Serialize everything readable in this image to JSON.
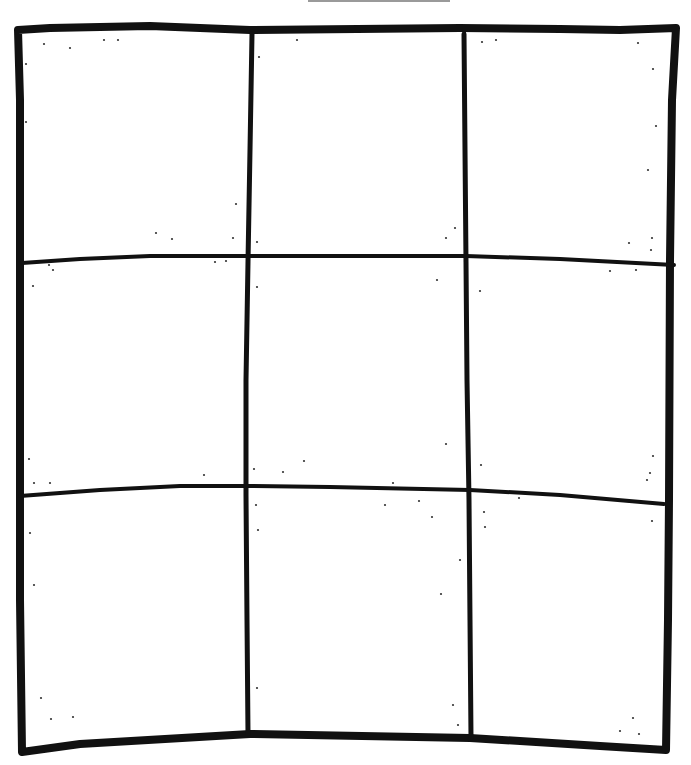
{
  "drawing": {
    "description": "Hand-drawn 3x3 grid",
    "rows": 3,
    "cols": 3,
    "stroke_color": "#111111",
    "top_bar": {
      "x": 308,
      "y": 0,
      "width": 142,
      "height": 2,
      "color": "#9a9a9a"
    },
    "outer_frame": {
      "stroke_width": 8,
      "points": [
        [
          18,
          30
        ],
        [
          50,
          28
        ],
        [
          150,
          26
        ],
        [
          250,
          30
        ],
        [
          460,
          28
        ],
        [
          560,
          29
        ],
        [
          620,
          30
        ],
        [
          676,
          28
        ],
        [
          672,
          100
        ],
        [
          670,
          260
        ],
        [
          669,
          500
        ],
        [
          668,
          620
        ],
        [
          666,
          750
        ],
        [
          600,
          746
        ],
        [
          470,
          738
        ],
        [
          250,
          734
        ],
        [
          80,
          744
        ],
        [
          22,
          752
        ],
        [
          20,
          600
        ],
        [
          20,
          420
        ],
        [
          20,
          262
        ],
        [
          20,
          100
        ],
        [
          18,
          30
        ]
      ]
    },
    "vertical_lines": [
      {
        "stroke_width": 5,
        "points": [
          [
            252,
            34
          ],
          [
            250,
            150
          ],
          [
            248,
            262
          ],
          [
            246,
            380
          ],
          [
            246,
            495
          ],
          [
            247,
            620
          ],
          [
            248,
            734
          ]
        ]
      },
      {
        "stroke_width": 5,
        "points": [
          [
            464,
            34
          ],
          [
            465,
            150
          ],
          [
            466,
            262
          ],
          [
            467,
            380
          ],
          [
            469,
            500
          ],
          [
            470,
            620
          ],
          [
            471,
            738
          ]
        ]
      }
    ],
    "horizontal_lines": [
      {
        "stroke_width": 4,
        "points": [
          [
            22,
            263
          ],
          [
            80,
            259
          ],
          [
            150,
            256
          ],
          [
            248,
            256
          ],
          [
            350,
            256
          ],
          [
            466,
            256
          ],
          [
            560,
            259
          ],
          [
            674,
            265
          ]
        ]
      },
      {
        "stroke_width": 4,
        "points": [
          [
            20,
            496
          ],
          [
            100,
            490
          ],
          [
            180,
            486
          ],
          [
            246,
            486
          ],
          [
            330,
            487
          ],
          [
            470,
            490
          ],
          [
            560,
            495
          ],
          [
            664,
            504
          ]
        ]
      }
    ],
    "specks": [
      [
        44,
        44
      ],
      [
        70,
        48
      ],
      [
        104,
        40
      ],
      [
        118,
        40
      ],
      [
        26,
        64
      ],
      [
        297,
        40
      ],
      [
        482,
        42
      ],
      [
        496,
        40
      ],
      [
        638,
        43
      ],
      [
        259,
        57
      ],
      [
        653,
        69
      ],
      [
        26,
        122
      ],
      [
        656,
        126
      ],
      [
        648,
        170
      ],
      [
        236,
        204
      ],
      [
        156,
        233
      ],
      [
        172,
        239
      ],
      [
        233,
        238
      ],
      [
        446,
        238
      ],
      [
        455,
        228
      ],
      [
        257,
        242
      ],
      [
        629,
        243
      ],
      [
        651,
        250
      ],
      [
        652,
        238
      ],
      [
        215,
        262
      ],
      [
        226,
        261
      ],
      [
        49,
        265
      ],
      [
        53,
        270
      ],
      [
        33,
        286
      ],
      [
        257,
        287
      ],
      [
        437,
        280
      ],
      [
        610,
        271
      ],
      [
        636,
        270
      ],
      [
        480,
        291
      ],
      [
        254,
        469
      ],
      [
        446,
        444
      ],
      [
        304,
        461
      ],
      [
        204,
        475
      ],
      [
        29,
        459
      ],
      [
        34,
        483
      ],
      [
        50,
        483
      ],
      [
        393,
        483
      ],
      [
        481,
        465
      ],
      [
        653,
        456
      ],
      [
        650,
        473
      ],
      [
        647,
        480
      ],
      [
        283,
        472
      ],
      [
        419,
        501
      ],
      [
        519,
        498
      ],
      [
        256,
        505
      ],
      [
        385,
        505
      ],
      [
        432,
        517
      ],
      [
        484,
        512
      ],
      [
        652,
        521
      ],
      [
        30,
        533
      ],
      [
        485,
        527
      ],
      [
        258,
        530
      ],
      [
        460,
        560
      ],
      [
        34,
        585
      ],
      [
        441,
        594
      ],
      [
        257,
        688
      ],
      [
        41,
        698
      ],
      [
        453,
        705
      ],
      [
        73,
        717
      ],
      [
        51,
        719
      ],
      [
        458,
        725
      ],
      [
        633,
        718
      ],
      [
        620,
        731
      ],
      [
        639,
        734
      ]
    ]
  }
}
